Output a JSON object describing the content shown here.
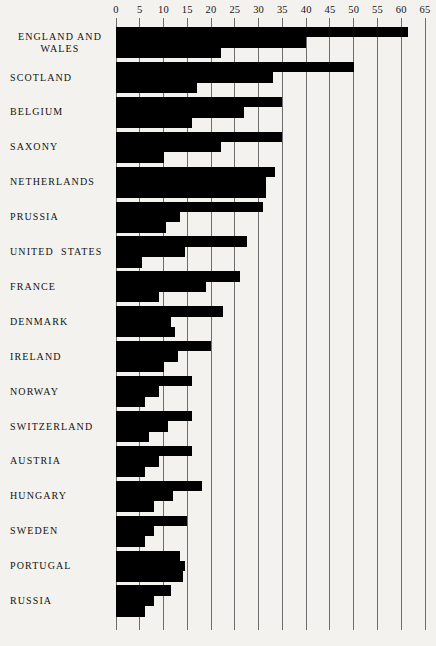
{
  "chart_data": {
    "type": "bar",
    "orientation": "horizontal",
    "title": "",
    "subtitle": "",
    "xlabel": "",
    "ylabel": "",
    "xlim": [
      0,
      65
    ],
    "xticks": [
      0,
      5,
      10,
      15,
      20,
      25,
      30,
      35,
      40,
      45,
      50,
      55,
      60,
      65
    ],
    "xtick_labels": [
      "0",
      "5",
      "10",
      "15",
      "20",
      "25",
      "30",
      "35",
      "40",
      "45",
      "50",
      "55",
      "60",
      "65"
    ],
    "grid": true,
    "grid_axis": "x",
    "legend": [],
    "legend_position": "none",
    "bar_color": "#000000",
    "background_color": "#f3f2ee",
    "categories": [
      "ENGLAND AND\nWALES",
      "SCOTLAND",
      "BELGIUM",
      "SAXONY",
      "NETHERLANDS",
      "PRUSSIA",
      "UNITED  STATES",
      "FRANCE",
      "DENMARK",
      "IRELAND",
      "NORWAY",
      "SWITZERLAND",
      "AUSTRIA",
      "HUNGARY",
      "SWEDEN",
      "PORTUGAL",
      "RUSSIA"
    ],
    "series": [
      {
        "name": "series-1",
        "values": [
          61.5,
          50.0,
          35.0,
          35.0,
          33.5,
          31.0,
          27.5,
          26.0,
          22.5,
          20.0,
          16.0,
          16.0,
          16.0,
          18.0,
          15.0,
          13.5,
          11.5
        ]
      },
      {
        "name": "series-2",
        "values": [
          40.0,
          33.0,
          27.0,
          22.0,
          31.5,
          13.5,
          14.5,
          19.0,
          11.5,
          13.0,
          9.0,
          11.0,
          9.0,
          12.0,
          8.0,
          14.5,
          8.0
        ]
      },
      {
        "name": "series-3",
        "values": [
          22.0,
          17.0,
          16.0,
          10.0,
          31.5,
          10.5,
          5.5,
          9.0,
          12.5,
          10.0,
          6.0,
          7.0,
          6.0,
          8.0,
          6.0,
          14.0,
          6.0
        ]
      }
    ]
  },
  "axis": {
    "ticks": [
      "0",
      "5",
      "10",
      "15",
      "20",
      "25",
      "30",
      "35",
      "40",
      "45",
      "50",
      "55",
      "60",
      "65"
    ]
  },
  "labels": {
    "england_wales_line1": "ENGLAND  AND",
    "england_wales_line2": "WALES",
    "scotland": "SCOTLAND",
    "belgium": "BELGIUM",
    "saxony": "SAXONY",
    "netherlands": "NETHERLANDS",
    "prussia": "PRUSSIA",
    "united_states": "UNITED  STATES",
    "france": "FRANCE",
    "denmark": "DENMARK",
    "ireland": "IRELAND",
    "norway": "NORWAY",
    "switzerland": "SWITZERLAND",
    "austria": "AUSTRIA",
    "hungary": "HUNGARY",
    "sweden": "SWEDEN",
    "portugal": "PORTUGAL",
    "russia": "RUSSIA"
  }
}
